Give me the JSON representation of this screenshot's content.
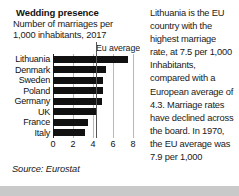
{
  "infographic": {
    "title": "Wedding presence",
    "subtitle_line1": "Number of marriages per",
    "subtitle_line2": "1,000 inhabitants, 2017",
    "eu_average_label": "Eu average",
    "source": "Source: Eurostat",
    "body_text": "Lithuania is the EU country with the highest marriage rate, at 7.5 per 1,000 Inhabitants, compared with a European average of 4.3. Marriage rates have declined across the board. In 1970, the EU average was 7.9 per 1,000"
  },
  "colors": {
    "bar": "#111111",
    "gridline": "#b8b8b8",
    "eu_average_line": "#555555",
    "page_background": "#c9c9c9",
    "panel_background": "#ffffff"
  },
  "chart_data": {
    "type": "bar",
    "orientation": "horizontal",
    "title": "Wedding presence",
    "subtitle": "Number of marriages per 1,000 inhabitants, 2017",
    "categories": [
      "Lithuania",
      "Denmark",
      "Sweden",
      "Poland",
      "Germany",
      "UK",
      "France",
      "Italy"
    ],
    "values": [
      7.5,
      5.3,
      5.0,
      5.0,
      4.9,
      4.4,
      3.5,
      3.2
    ],
    "xlabel": "",
    "ylabel": "",
    "xlim": [
      0,
      8.8
    ],
    "xticks": [
      0,
      2,
      4,
      6,
      8
    ],
    "xtick_labels": [
      "0",
      "2",
      "4",
      "6",
      "8"
    ],
    "grid": true,
    "legend": false,
    "annotations": [
      {
        "name": "eu-average",
        "label": "Eu average",
        "value": 4.3
      }
    ],
    "source": "Source: Eurostat"
  }
}
